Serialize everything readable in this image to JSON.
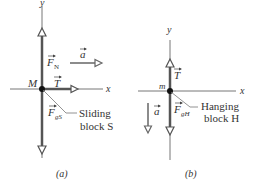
{
  "panel_a": {
    "caption": "(a)",
    "axis_x": "x",
    "axis_y": "y",
    "point": "M",
    "force_normal": "F",
    "force_normal_sub": "N",
    "tension": "T",
    "force_gravity": "F",
    "force_gravity_sub": "gS",
    "accel": "a",
    "block_label_line1": "Sliding",
    "block_label_line2": "block S"
  },
  "panel_b": {
    "caption": "(b)",
    "axis_x": "x",
    "axis_y": "y",
    "point": "m",
    "tension": "T",
    "force_gravity": "F",
    "force_gravity_sub": "gH",
    "accel": "a",
    "block_label_line1": "Hanging",
    "block_label_line2": "block H"
  },
  "colors": {
    "axis": "#555555",
    "vector": "#555555",
    "text": "#333333"
  }
}
